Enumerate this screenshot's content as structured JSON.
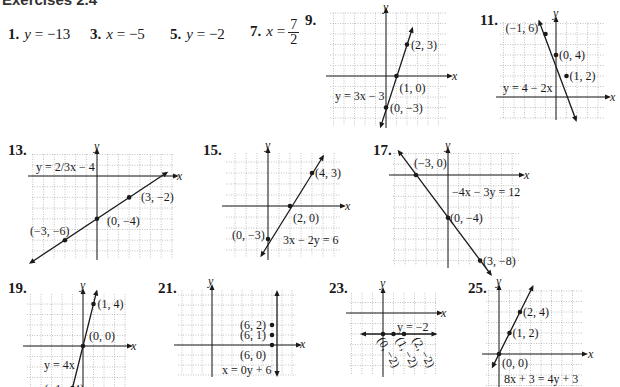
{
  "heading": "Exercises 2.4",
  "answers": [
    {
      "number": "1.",
      "variable": "y",
      "rhs": "= −13"
    },
    {
      "number": "3.",
      "variable": "x",
      "rhs": "= −5"
    },
    {
      "number": "5.",
      "variable": "y",
      "rhs": "= −2"
    },
    {
      "number": "7.",
      "variable": "x",
      "rhs": "=",
      "fraction": {
        "numerator": "7",
        "denominator": "2"
      }
    }
  ],
  "graphs": [
    {
      "number": "9.",
      "equation": "y = 3x − 3",
      "points": [
        "(2, 3)",
        "(1, 0)",
        "(0, −3)"
      ],
      "x_label": "x",
      "y_label": "y"
    },
    {
      "number": "11.",
      "equation": "y = 4 − 2x",
      "points": [
        "(−1, 6)",
        "(0, 4)",
        "(1, 2)"
      ],
      "x_label": "x",
      "y_label": "y"
    },
    {
      "number": "13.",
      "equation": "y = 2/3x − 4",
      "points": [
        "(3, −2)",
        "(0, −4)",
        "(−3, −6)"
      ],
      "x_label": "x",
      "y_label": "y"
    },
    {
      "number": "15.",
      "equation": "3x − 2y = 6",
      "points": [
        "(4, 3)",
        "(2, 0)",
        "(0, −3)"
      ],
      "x_label": "x",
      "y_label": "y"
    },
    {
      "number": "17.",
      "equation": "−4x − 3y = 12",
      "points": [
        "(−3, 0)",
        "(0, −4)",
        "(3, −8)"
      ],
      "x_label": "x",
      "y_label": "y"
    },
    {
      "number": "19.",
      "equation": "y = 4x",
      "points": [
        "(1, 4)",
        "(0, 0)",
        "(−1, −4)"
      ],
      "x_label": "x",
      "y_label": "y"
    },
    {
      "number": "21.",
      "equation": "x = 0y + 6",
      "points": [
        "(6, 2)",
        "(6, 1)",
        "(6, 0)"
      ],
      "x_label": "x",
      "y_label": "y"
    },
    {
      "number": "23.",
      "equation": "y = −2",
      "points": [
        "(0, −2)",
        "(1, −2)",
        "(2, −2)"
      ],
      "x_label": "x",
      "y_label": "y"
    },
    {
      "number": "25.",
      "equation": "8x + 3 = 4y + 3",
      "points": [
        "(2, 4)",
        "(1, 2)",
        "(0, 0)"
      ],
      "x_label": "x",
      "y_label": "y"
    }
  ],
  "colors": {
    "ink": "#1a1a1a",
    "grid": "#9a9a9a"
  }
}
